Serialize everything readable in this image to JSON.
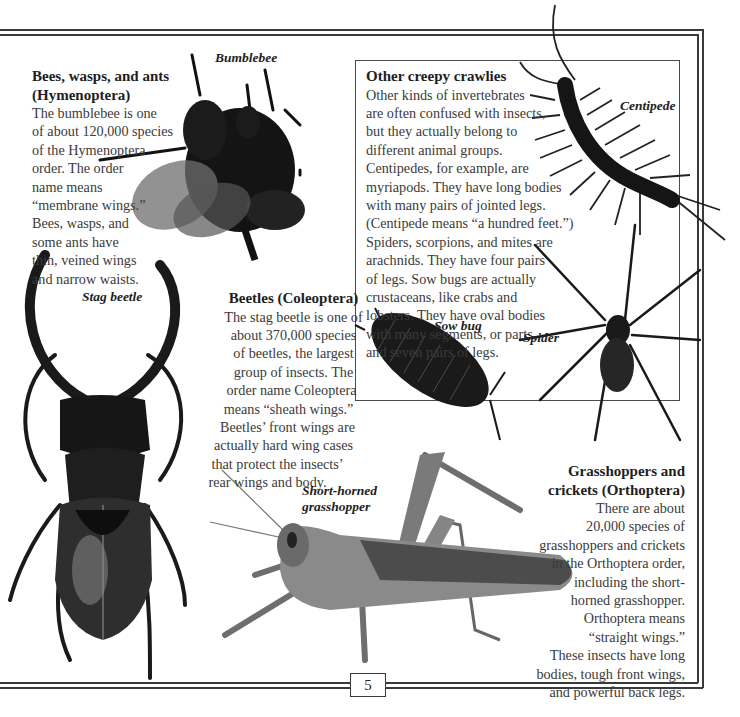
{
  "page": {
    "page_number": "5",
    "colors": {
      "frame": "#3a3a3a",
      "text": "#3a3a3a",
      "heading": "#1e1e1e",
      "background": "#ffffff"
    }
  },
  "hymenoptera": {
    "heading": [
      "Bees, wasps, and ants",
      "(Hymenoptera)"
    ],
    "lines": [
      "The bumblebee is one",
      "of about 120,000 species",
      "of the Hymenoptera",
      "order. The order",
      "name means",
      "“membrane wings.”",
      "Bees, wasps, and",
      "some ants have",
      "thin, veined wings",
      "and narrow waists."
    ]
  },
  "coleoptera": {
    "heading": "Beetles (Coleoptera)",
    "lines": [
      "The stag beetle is one of",
      "about 370,000 species",
      "of beetles, the largest",
      "group of insects. The",
      "order name Coleoptera",
      "means “sheath wings.”",
      "Beetles’ front wings are",
      "actually hard wing cases",
      "that protect the insects’",
      "rear wings and body."
    ]
  },
  "other_crawlies": {
    "heading": "Other creepy crawlies",
    "lines": [
      "Other kinds of invertebrates",
      "are often confused with insects,",
      "but they actually belong to",
      "different animal groups.",
      "Centipedes, for example, are",
      "myriapods. They have long bodies",
      "with many pairs of jointed legs.",
      "(Centipede means “a hundred feet.”)",
      "Spiders, scorpions, and mites are",
      "arachnids. They have four pairs",
      "of legs. Sow bugs are actually",
      "crustaceans, like crabs and",
      "lobsters. They have oval bodies",
      "with many segments, or parts,",
      "and seven pairs of legs."
    ]
  },
  "orthoptera": {
    "heading": [
      "Grasshoppers and",
      "crickets (Orthoptera)"
    ],
    "lines": [
      "There are about",
      "20,000 species of",
      "grasshoppers and crickets",
      "in the Orthoptera order,",
      "including the short-",
      "horned grasshopper.",
      "Orthoptera means",
      "“straight wings.”",
      "These insects have long",
      "bodies, tough front wings,",
      "and powerful back legs."
    ]
  },
  "captions": {
    "bumblebee": "Bumblebee",
    "stag_beetle": "Stag beetle",
    "centipede": "Centipede",
    "sow_bug": "Sow bug",
    "spider": "Spider",
    "grasshopper": [
      "Short-horned",
      "grasshopper"
    ]
  }
}
